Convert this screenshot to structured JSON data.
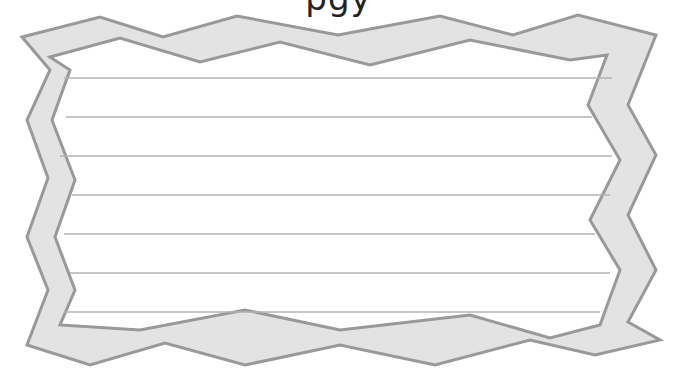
{
  "heading": {
    "text": "pgy"
  },
  "frame": {
    "fill_color": "#e3e3e3",
    "border_color": "#999999",
    "inner_fill_color": "#ffffff",
    "rule_color": "#b3b3b3",
    "rule_count": 7
  }
}
